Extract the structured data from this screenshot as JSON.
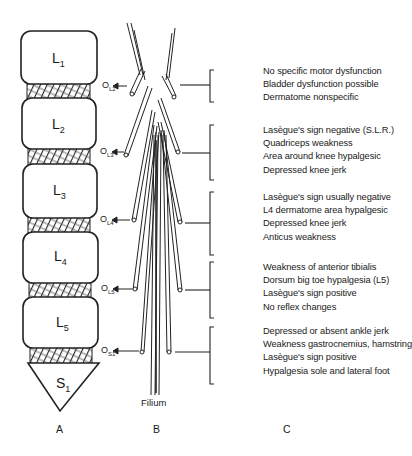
{
  "vertebrae": [
    {
      "name": "L",
      "sub": "1"
    },
    {
      "name": "L",
      "sub": "2"
    },
    {
      "name": "L",
      "sub": "3"
    },
    {
      "name": "L",
      "sub": "4"
    },
    {
      "name": "L",
      "sub": "5"
    },
    {
      "name": "S",
      "sub": "1"
    }
  ],
  "outlets": [
    {
      "name": "O",
      "sub": "L2"
    },
    {
      "name": "O",
      "sub": "L3"
    },
    {
      "name": "O",
      "sub": "L4"
    },
    {
      "name": "O",
      "sub": "L5"
    },
    {
      "name": "O",
      "sub": "S1"
    }
  ],
  "filium_label": "Filium",
  "column_labels": {
    "a": "A",
    "b": "B",
    "c": "C"
  },
  "groups": [
    {
      "lines": [
        "No specific motor dysfunction",
        "Bladder dysfunction possible",
        "Dermatome nonspecific"
      ]
    },
    {
      "lines": [
        "Lasègue's sign negative (S.L.R.)",
        "Quadriceps weakness",
        "Area around knee hypalgesic",
        "Depressed knee jerk"
      ]
    },
    {
      "lines": [
        "Lasègue's sign usually negative",
        "L4 dermatome area hypalgesic",
        "Depressed knee jerk",
        "Anticus weakness"
      ]
    },
    {
      "lines": [
        "Weakness of anterior tibialis",
        "Dorsum big toe hypalgesia (L5)",
        "Lasègue's sign positive",
        "No reflex changes"
      ]
    },
    {
      "lines": [
        "Depressed or absent ankle jerk",
        "Weakness gastrocnemius, hamstring",
        "Lasègue's sign positive",
        "Hypalgesia sole and lateral foot"
      ]
    }
  ]
}
